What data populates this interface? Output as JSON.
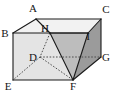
{
  "figure": {
    "kind": "geometry-diagram",
    "canvas": {
      "width": 117,
      "height": 92
    },
    "colors": {
      "stroke": "#1a1a1a",
      "hidden_stroke": "#555555",
      "background": "#ffffff",
      "face_left_front": "#e2e2e2",
      "face_top": "#f2f2f2",
      "face_right": "#9b9b9b",
      "triangle_fill": "#bdbdbd",
      "label": "#161616"
    },
    "vertices": [
      {
        "name": "A",
        "label": "A",
        "x": 36,
        "y": 19,
        "label_x": 33,
        "label_y": 12
      },
      {
        "name": "B",
        "label": "B",
        "x": 13,
        "y": 33,
        "label_x": 4,
        "label_y": 37
      },
      {
        "name": "C",
        "label": "C",
        "x": 101,
        "y": 19,
        "label_x": 101,
        "label_y": 13
      },
      {
        "name": "H",
        "label": "H",
        "x": 50,
        "y": 33,
        "label_x": 41,
        "label_y": 31
      },
      {
        "name": "I",
        "label": "I",
        "x": 88,
        "y": 33,
        "label_x": 87,
        "label_y": 38
      },
      {
        "name": "D",
        "label": "D",
        "x": 40,
        "y": 57,
        "label_x": 30,
        "label_y": 61
      },
      {
        "name": "G",
        "label": "G",
        "x": 101,
        "y": 57,
        "label_x": 101,
        "label_y": 61
      },
      {
        "name": "E",
        "label": "E",
        "x": 13,
        "y": 80,
        "label_x": 5,
        "label_y": 90
      },
      {
        "name": "F",
        "label": "F",
        "x": 73,
        "y": 80,
        "label_x": 70,
        "label_y": 90
      }
    ],
    "solid_edges": [
      {
        "from": "B",
        "to": "A"
      },
      {
        "from": "A",
        "to": "C"
      },
      {
        "from": "B",
        "to": "I"
      },
      {
        "from": "I",
        "to": "C"
      },
      {
        "from": "C",
        "to": "G"
      },
      {
        "from": "B",
        "to": "E"
      },
      {
        "from": "E",
        "to": "F"
      },
      {
        "from": "F",
        "to": "G"
      },
      {
        "from": "H",
        "to": "I"
      },
      {
        "from": "H",
        "to": "F"
      },
      {
        "from": "I",
        "to": "F"
      },
      {
        "from": "A",
        "to": "H"
      }
    ],
    "hidden_edges": [
      {
        "from": "H",
        "to": "D"
      },
      {
        "from": "D",
        "to": "G"
      },
      {
        "from": "D",
        "to": "E"
      },
      {
        "from": "D",
        "to": "F"
      }
    ],
    "shaded_faces": [
      {
        "name": "triangle-HIF",
        "points": "H,I,F",
        "shade": "triangle_fill"
      },
      {
        "name": "right-face-ICGF",
        "points": "I,C,G,F",
        "shade": "face_right"
      },
      {
        "name": "front-left-face-BEFI",
        "points": "B,E,F,I",
        "shade": "face_left_front"
      },
      {
        "name": "top-face-BACI",
        "points": "B,A,C,I",
        "shade": "face_top"
      }
    ],
    "labels_text": [
      "A",
      "B",
      "C",
      "H",
      "I",
      "D",
      "G",
      "E",
      "F"
    ]
  }
}
